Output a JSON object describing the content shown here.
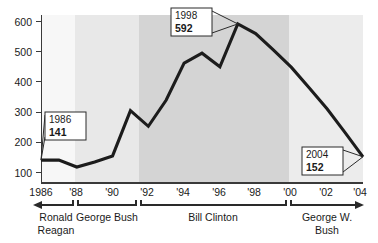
{
  "chart_data": {
    "type": "line",
    "title": "",
    "subtitle": "",
    "xlabel": "",
    "ylabel": "",
    "xlim": [
      1986,
      2004
    ],
    "ylim": [
      0,
      600
    ],
    "yticks": [
      100,
      200,
      300,
      400,
      500,
      600
    ],
    "ytick_labels": [
      "100",
      "200",
      "300",
      "400",
      "500",
      "600"
    ],
    "xticks": [
      1986,
      1988,
      1990,
      1992,
      1994,
      1996,
      1998,
      2000,
      2002,
      2004
    ],
    "xtick_labels": [
      "1986",
      "'88",
      "'90",
      "'92",
      "'94",
      "'96",
      "'98",
      "'00",
      "'02",
      "'04"
    ],
    "grid": false,
    "legend": false,
    "x": [
      1986,
      1987,
      1988,
      1989,
      1990,
      1991,
      1992,
      1993,
      1994,
      1995,
      1996,
      1997,
      1998,
      1999,
      2000,
      2001,
      2002,
      2003,
      2004
    ],
    "values": [
      141,
      141,
      118,
      135,
      155,
      305,
      253,
      340,
      462,
      495,
      450,
      592,
      560,
      505,
      448,
      380,
      310,
      232,
      152
    ],
    "series": [
      {
        "name": "value",
        "values": [
          141,
          141,
          118,
          135,
          155,
          305,
          253,
          340,
          462,
          495,
          450,
          592,
          560,
          505,
          448,
          380,
          310,
          232,
          152
        ]
      }
    ],
    "annotations": [
      {
        "year": "1986",
        "value": "141",
        "x": 1986,
        "y": 141
      },
      {
        "year": "1998",
        "value": "592",
        "x": 1997,
        "y": 592
      },
      {
        "year": "2004",
        "value": "152",
        "x": 2004,
        "y": 152
      }
    ],
    "bands": [
      {
        "label": "Ronald Reagan",
        "start": 1986,
        "end": 1988,
        "color": "#f7f7f7"
      },
      {
        "label": "George Bush",
        "start": 1988,
        "end": 1992,
        "color": "#e8e8e8"
      },
      {
        "label": "Bill Clinton",
        "start": 1992,
        "end": 2000,
        "color": "#d4d4d4"
      },
      {
        "label": "George W. Bush",
        "start": 2000,
        "end": 2004,
        "color": "#ececec"
      }
    ]
  },
  "axis": {
    "y_ticks": [
      {
        "label": "600"
      },
      {
        "label": "500"
      },
      {
        "label": "400"
      },
      {
        "label": "300"
      },
      {
        "label": "200"
      },
      {
        "label": "100"
      }
    ],
    "x_ticks": [
      {
        "label": "1986"
      },
      {
        "label": "'88"
      },
      {
        "label": "'90"
      },
      {
        "label": "'92"
      },
      {
        "label": "'94"
      },
      {
        "label": "'96"
      },
      {
        "label": "'98"
      },
      {
        "label": "'00"
      },
      {
        "label": "'02"
      },
      {
        "label": "'04"
      }
    ]
  },
  "callouts": [
    {
      "year": "1986",
      "value": "141"
    },
    {
      "year": "1998",
      "value": "592"
    },
    {
      "year": "2004",
      "value": "152"
    }
  ],
  "presidents": [
    {
      "line1": "Ronald",
      "line2": "Reagan",
      "single": ""
    },
    {
      "line1": "George Bush",
      "line2": "",
      "single": "George Bush"
    },
    {
      "line1": "Bill Clinton",
      "line2": "",
      "single": "Bill Clinton"
    },
    {
      "line1": "George W.",
      "line2": "Bush",
      "single": ""
    }
  ],
  "colors": {
    "line": "#1c1c1c",
    "band1": "#f7f7f7",
    "band2": "#e8e8e8",
    "band3": "#d4d4d4",
    "band4": "#ececec",
    "axis": "#3a3a3a",
    "text": "#1a1a1a"
  }
}
